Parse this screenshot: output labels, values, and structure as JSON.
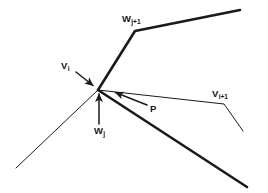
{
  "figure": {
    "background_color": "#ffffff",
    "ink_color": "#1a1a1a",
    "labels": {
      "w_j_plus_1": {
        "base": "W",
        "sub": "j+1",
        "full": "Wj+1"
      },
      "v_i": {
        "base": "V",
        "sub": "i",
        "full": "Vi"
      },
      "v_i_plus_1": {
        "base": "V",
        "sub": "i+1",
        "full": "Vi+1"
      },
      "p": {
        "base": "P",
        "sub": "",
        "full": "P"
      },
      "w_j": {
        "base": "W",
        "sub": "j",
        "full": "Wj"
      }
    },
    "geometry": {
      "vertex": {
        "x": 98,
        "y": 90
      },
      "thick_polyline_upper": {
        "name": "offset-polyline-upper",
        "stroke_width": 2.6,
        "points": [
          [
            98,
            90
          ],
          [
            135,
            31
          ],
          [
            240,
            10
          ]
        ]
      },
      "thick_polyline_lower": {
        "name": "offset-polyline-lower",
        "stroke_width": 2.6,
        "points": [
          [
            98,
            90
          ],
          [
            247,
            187
          ]
        ]
      },
      "thin_polyline_right": {
        "name": "source-polyline-right",
        "stroke_width": 1.0,
        "points": [
          [
            98,
            90
          ],
          [
            224,
            104
          ],
          [
            243,
            131
          ]
        ]
      },
      "thin_polyline_left": {
        "name": "source-polyline-left",
        "stroke_width": 1.0,
        "points": [
          [
            98,
            90
          ],
          [
            16,
            168
          ]
        ]
      },
      "arrows": [
        {
          "name": "vi-leader-arrow",
          "from": [
            76,
            72
          ],
          "to": [
            94,
            86
          ],
          "stroke_width": 1.5
        },
        {
          "name": "wj-vector-arrow",
          "from": [
            99,
            124
          ],
          "to": [
            99,
            93
          ],
          "stroke_width": 1.5
        },
        {
          "name": "p-leader-arrow",
          "from": [
            147,
            105
          ],
          "to": [
            114,
            92
          ],
          "stroke_width": 1.5
        }
      ]
    }
  }
}
